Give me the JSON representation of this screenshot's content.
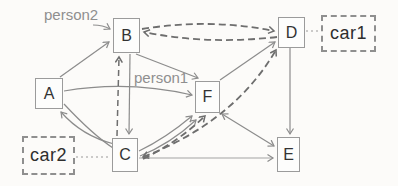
{
  "diagram": {
    "type": "graph",
    "nodes": [
      {
        "id": "A",
        "label": "A",
        "shape": "solid-box"
      },
      {
        "id": "B",
        "label": "B",
        "shape": "solid-box"
      },
      {
        "id": "C",
        "label": "C",
        "shape": "solid-box"
      },
      {
        "id": "D",
        "label": "D",
        "shape": "solid-box"
      },
      {
        "id": "E",
        "label": "E",
        "shape": "solid-box"
      },
      {
        "id": "F",
        "label": "F",
        "shape": "solid-box"
      },
      {
        "id": "car1",
        "label": "car1",
        "shape": "dashed-box"
      },
      {
        "id": "car2",
        "label": "car2",
        "shape": "dashed-box"
      }
    ],
    "annotations": [
      {
        "id": "person2",
        "label": "person2",
        "points_to": "B"
      },
      {
        "id": "person1",
        "label": "person1",
        "points_to": "F"
      }
    ],
    "edges": [
      {
        "from": "A",
        "to": "B",
        "style": "solid",
        "arrow": "to"
      },
      {
        "from": "B",
        "to": "C",
        "style": "solid",
        "arrow": "to"
      },
      {
        "from": "C",
        "to": "B",
        "style": "dashed",
        "arrow": "to"
      },
      {
        "from": "B",
        "to": "D",
        "style": "dashed",
        "arrow": "to"
      },
      {
        "from": "D",
        "to": "B",
        "style": "dashed",
        "arrow": "to"
      },
      {
        "from": "B",
        "to": "F",
        "style": "solid",
        "arrow": "to"
      },
      {
        "from": "F",
        "to": "D",
        "style": "solid",
        "arrow": "to"
      },
      {
        "from": "D",
        "to": "E",
        "style": "solid",
        "arrow": "to"
      },
      {
        "from": "F",
        "to": "E",
        "style": "solid",
        "arrow": "both"
      },
      {
        "from": "C",
        "to": "E",
        "style": "solid",
        "arrow": "to"
      },
      {
        "from": "C",
        "to": "F",
        "style": "solid",
        "arrow": "to"
      },
      {
        "from": "C",
        "to": "F",
        "style": "solid",
        "arrow": "to"
      },
      {
        "from": "C",
        "to": "F",
        "style": "dashed",
        "arrow": "to"
      },
      {
        "from": "C",
        "to": "D",
        "style": "dashed",
        "arrow": "both"
      },
      {
        "from": "C",
        "to": "A",
        "style": "solid",
        "arrow": "to"
      },
      {
        "from": "A",
        "to": "C",
        "style": "solid",
        "arrow": "none"
      },
      {
        "from": "A",
        "to": "F",
        "style": "solid",
        "arrow": "to"
      },
      {
        "from": "car1",
        "to": "D",
        "style": "dotted",
        "arrow": "none"
      },
      {
        "from": "car2",
        "to": "C",
        "style": "dotted",
        "arrow": "none"
      }
    ],
    "colors": {
      "background": "#fcfbf9",
      "solid_edge": "#8c8c8c",
      "dashed_edge": "#6e6e6e",
      "dotted_link": "#999999",
      "box_border": "#9b9b9b",
      "node_text": "#333333",
      "annotation_text": "#8f8f8f"
    }
  }
}
